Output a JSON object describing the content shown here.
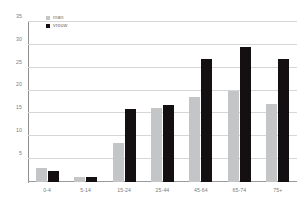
{
  "chart_data": {
    "type": "bar",
    "title": "",
    "subtitle": "",
    "xlabel": "",
    "ylabel": "",
    "categories": [
      "0-4",
      "5-14",
      "15-24",
      "25-44",
      "45-64",
      "65-74",
      "75+"
    ],
    "series": [
      {
        "name": "man",
        "color": "#c3c5c6",
        "values": [
          3,
          1,
          8.5,
          16.3,
          18.5,
          20,
          17
        ]
      },
      {
        "name": "vrouw",
        "color": "#141011",
        "values": [
          2.5,
          1.2,
          16,
          16.8,
          27,
          29.5,
          27
        ]
      }
    ],
    "ylim": [
      0,
      35
    ],
    "ytick_values": [
      0,
      5,
      10,
      15,
      20,
      25,
      30,
      35
    ],
    "ytick_labels": [
      "0",
      "5",
      "10",
      "15",
      "20",
      "25",
      "30",
      "35"
    ],
    "grid": true,
    "grid_axis": "y",
    "legend_position": "top-left",
    "legend_entries": [
      "man",
      "vrouw"
    ]
  },
  "legend": {
    "items": [
      {
        "label": "man",
        "swatch": "legend-swatch-man"
      },
      {
        "label": "vrouw",
        "swatch": "legend-swatch-vrouw"
      }
    ]
  }
}
